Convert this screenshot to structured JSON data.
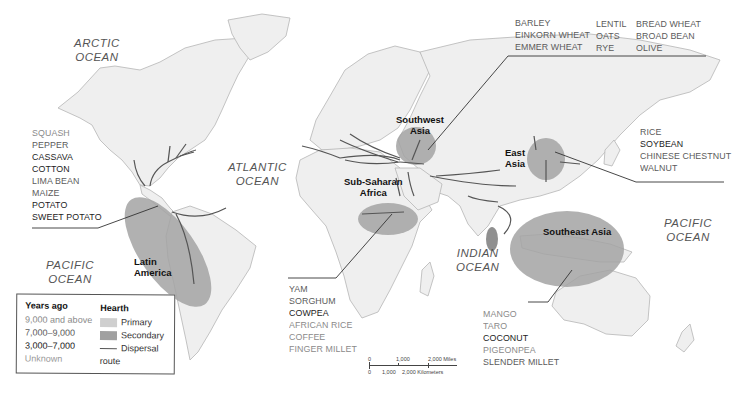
{
  "oceans": {
    "arctic": [
      "ARCTIC",
      "OCEAN"
    ],
    "atlantic": [
      "ATLANTIC",
      "OCEAN"
    ],
    "pacific_west": [
      "PACIFIC",
      "OCEAN"
    ],
    "indian": [
      "INDIAN",
      "OCEAN"
    ],
    "pacific_east": [
      "PACIFIC",
      "OCEAN"
    ]
  },
  "hearths": {
    "latin_america": {
      "label": [
        "Latin",
        "America"
      ],
      "type": "Secondary",
      "crops": [
        {
          "name": "SQUASH",
          "age": "9,000 and above"
        },
        {
          "name": "PEPPER",
          "age": "7,000–9,000"
        },
        {
          "name": "CASSAVA",
          "age": "3,000–7,000"
        },
        {
          "name": "COTTON",
          "age": "3,000–7,000"
        },
        {
          "name": "LIMA BEAN",
          "age": "7,000–9,000"
        },
        {
          "name": "MAIZE",
          "age": "7,000–9,000"
        },
        {
          "name": "POTATO",
          "age": "3,000–7,000"
        },
        {
          "name": "SWEET POTATO",
          "age": "3,000–7,000"
        }
      ]
    },
    "southwest_asia": {
      "label": [
        "Southwest",
        "Asia"
      ],
      "type": "Secondary",
      "crops": [
        {
          "name": "BARLEY",
          "age": "7,000–9,000"
        },
        {
          "name": "EINKORN WHEAT",
          "age": "7,000–9,000"
        },
        {
          "name": "EMMER WHEAT",
          "age": "7,000–9,000"
        },
        {
          "name": "LENTIL",
          "age": "7,000–9,000"
        },
        {
          "name": "OATS",
          "age": "7,000–9,000"
        },
        {
          "name": "RYE",
          "age": "7,000–9,000"
        },
        {
          "name": "BREAD WHEAT",
          "age": "7,000–9,000"
        },
        {
          "name": "BROAD BEAN",
          "age": "7,000–9,000"
        },
        {
          "name": "OLIVE",
          "age": "7,000–9,000"
        }
      ]
    },
    "east_asia": {
      "label": [
        "East",
        "Asia"
      ],
      "type": "Secondary",
      "crops": [
        {
          "name": "RICE",
          "age": "7,000–9,000"
        },
        {
          "name": "SOYBEAN",
          "age": "3,000–7,000"
        },
        {
          "name": "CHINESE CHESTNUT",
          "age": "7,000–9,000"
        },
        {
          "name": "WALNUT",
          "age": "7,000–9,000"
        }
      ]
    },
    "sub_saharan_africa": {
      "label": [
        "Sub-Saharan",
        "Africa"
      ],
      "type": "Secondary",
      "crops": [
        {
          "name": "YAM",
          "age": "7,000–9,000"
        },
        {
          "name": "SORGHUM",
          "age": "7,000–9,000"
        },
        {
          "name": "COWPEA",
          "age": "3,000–7,000"
        },
        {
          "name": "AFRICAN RICE",
          "age": "9,000 and above"
        },
        {
          "name": "COFFEE",
          "age": "9,000 and above"
        },
        {
          "name": "FINGER MILLET",
          "age": "9,000 and above"
        }
      ]
    },
    "southeast_asia": {
      "label": [
        "Southeast Asia"
      ],
      "type": "Secondary",
      "crops": [
        {
          "name": "MANGO",
          "age": "9,000 and above"
        },
        {
          "name": "TARO",
          "age": "9,000 and above"
        },
        {
          "name": "COCONUT",
          "age": "3,000–7,000"
        },
        {
          "name": "PIGEONPEA",
          "age": "9,000 and above"
        },
        {
          "name": "SLENDER MILLET",
          "age": "7,000–9,000"
        }
      ]
    }
  },
  "legend": {
    "years_title": "Years ago",
    "years": [
      "9,000 and above",
      "7,000–9,000",
      "3,000–7,000",
      "Unknown"
    ],
    "hearth_title": "Hearth",
    "hearth_items": [
      "Primary",
      "Secondary",
      "Dispersal route"
    ]
  },
  "scale": {
    "miles": [
      "0",
      "1,000",
      "2,000 Miles"
    ],
    "km": [
      "0",
      "1,000",
      "2,000 Kilometers"
    ]
  },
  "colors": {
    "land": "#efefef",
    "land_border": "#b9b9b9",
    "primary_hearth": "#c8c8c8",
    "secondary_hearth": "#a3a3a3",
    "route": "#555555"
  }
}
